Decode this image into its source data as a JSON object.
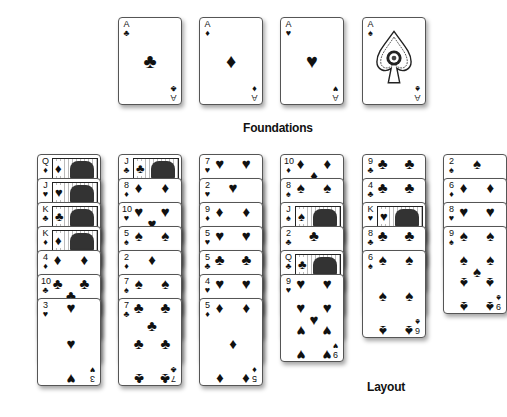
{
  "foundations": {
    "label": "Foundations",
    "cards": [
      {
        "rank": "A",
        "suit": "clubs",
        "symbol": "♣"
      },
      {
        "rank": "A",
        "suit": "diamonds",
        "symbol": "♦"
      },
      {
        "rank": "A",
        "suit": "hearts",
        "symbol": "♥"
      },
      {
        "rank": "A",
        "suit": "spades",
        "symbol": "♠"
      }
    ]
  },
  "layout": {
    "label": "Layout",
    "columns": [
      {
        "cards": [
          {
            "rank": "Q",
            "symbol": "♦"
          },
          {
            "rank": "J",
            "symbol": "♥"
          },
          {
            "rank": "K",
            "symbol": "♣"
          },
          {
            "rank": "K",
            "symbol": "♦"
          },
          {
            "rank": "4",
            "symbol": "♦"
          },
          {
            "rank": "10",
            "symbol": "♣"
          },
          {
            "rank": "3",
            "symbol": "♥"
          }
        ]
      },
      {
        "cards": [
          {
            "rank": "J",
            "symbol": "♣"
          },
          {
            "rank": "8",
            "symbol": "♦"
          },
          {
            "rank": "10",
            "symbol": "♥"
          },
          {
            "rank": "5",
            "symbol": "♠"
          },
          {
            "rank": "2",
            "symbol": "♦"
          },
          {
            "rank": "7",
            "symbol": "♠"
          },
          {
            "rank": "7",
            "symbol": "♣"
          }
        ]
      },
      {
        "cards": [
          {
            "rank": "7",
            "symbol": "♥"
          },
          {
            "rank": "2",
            "symbol": "♥"
          },
          {
            "rank": "9",
            "symbol": "♦"
          },
          {
            "rank": "5",
            "symbol": "♥"
          },
          {
            "rank": "5",
            "symbol": "♣"
          },
          {
            "rank": "4",
            "symbol": "♥"
          },
          {
            "rank": "5",
            "symbol": "♦"
          }
        ]
      },
      {
        "cards": [
          {
            "rank": "10",
            "symbol": "♦"
          },
          {
            "rank": "8",
            "symbol": "♠"
          },
          {
            "rank": "J",
            "symbol": "♠"
          },
          {
            "rank": "2",
            "symbol": "♣"
          },
          {
            "rank": "Q",
            "symbol": "♣"
          },
          {
            "rank": "9",
            "symbol": "♥"
          }
        ]
      },
      {
        "cards": [
          {
            "rank": "9",
            "symbol": "♣"
          },
          {
            "rank": "4",
            "symbol": "♣"
          },
          {
            "rank": "K",
            "symbol": "♥"
          },
          {
            "rank": "8",
            "symbol": "♣"
          },
          {
            "rank": "6",
            "symbol": "♠"
          }
        ]
      },
      {
        "cards": [
          {
            "rank": "2",
            "symbol": "♠"
          },
          {
            "rank": "6",
            "symbol": "♦"
          },
          {
            "rank": "8",
            "symbol": "♥"
          },
          {
            "rank": "9",
            "symbol": "♠"
          }
        ]
      }
    ]
  }
}
